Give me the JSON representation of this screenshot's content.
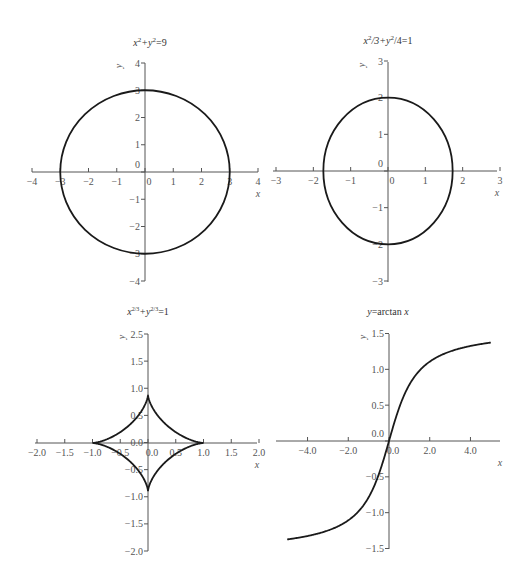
{
  "chart_data": [
    {
      "id": "circle",
      "type": "line",
      "title": "x²+y²=9",
      "equation": "x^2+y^2=9",
      "xlabel": "x",
      "ylabel": "y",
      "xlim": [
        -4,
        4
      ],
      "ylim": [
        -4,
        4
      ],
      "x_ticks": [
        -4,
        -3,
        -2,
        -1,
        0,
        1,
        2,
        3,
        4
      ],
      "y_ticks": [
        -4,
        -3,
        -2,
        -1,
        0,
        1,
        2,
        3,
        4
      ],
      "grid": false,
      "curve": {
        "kind": "ellipse",
        "a": 3,
        "b": 3
      },
      "box": {
        "left": 32,
        "top": 63,
        "right": 258,
        "bottom": 281,
        "ox": 145,
        "oy": 172
      },
      "title_pos": {
        "x": 150,
        "y": 42
      }
    },
    {
      "id": "ellipse",
      "type": "line",
      "title": "x²/3+y²/4=1",
      "equation": "x^2/3+y^2/4=1",
      "xlabel": "x",
      "ylabel": "y",
      "xlim": [
        -3,
        3
      ],
      "ylim": [
        -3,
        3
      ],
      "x_ticks": [
        -3,
        -2,
        -1,
        0,
        1,
        2,
        3
      ],
      "y_ticks": [
        -3,
        -2,
        -1,
        0,
        1,
        2,
        3
      ],
      "grid": false,
      "curve": {
        "kind": "ellipse",
        "a": 1.732,
        "b": 2
      },
      "box": {
        "left": 273,
        "top": 62,
        "right": 497,
        "bottom": 282,
        "ox": 388,
        "oy": 171
      },
      "title_pos": {
        "x": 388,
        "y": 40
      }
    },
    {
      "id": "astroid",
      "type": "line",
      "title": "x²ᐟ³+y²ᐟ³=1",
      "equation": "x^(2/3)+y^(2/3)=1",
      "xlabel": "x",
      "ylabel": "y",
      "xlim": [
        -2.0,
        2.0
      ],
      "ylim": [
        -2.0,
        2.5
      ],
      "x_ticks": [
        -2.0,
        -1.5,
        -1.0,
        -0.5,
        0.0,
        0.5,
        1.0,
        1.5,
        2.0
      ],
      "y_tick_labels": [
        "2.5",
        "1.5",
        "1.0",
        "0.5",
        "0.0",
        "-0.5",
        "-1.0",
        "-1.5",
        "-2.0"
      ],
      "grid": false,
      "curve": {
        "kind": "astroid",
        "a": 1
      },
      "box": {
        "left": 35,
        "top": 334,
        "right": 257,
        "bottom": 551,
        "ox": 148,
        "oy": 443
      },
      "title_pos": {
        "x": 148,
        "y": 313
      }
    },
    {
      "id": "arctan",
      "type": "line",
      "title": "y=arctan x",
      "equation": "y=arctan(x)",
      "xlabel": "x",
      "ylabel": "y",
      "xlim": [
        -5.5,
        5.5
      ],
      "ylim": [
        -1.5,
        1.5
      ],
      "x_ticks": [
        -4,
        -2,
        0,
        2,
        4
      ],
      "y_ticks": [
        -1.5,
        -1.0,
        -0.5,
        0.0,
        0.5,
        1.0,
        1.5
      ],
      "grid": false,
      "curve": {
        "kind": "arctan",
        "x_range": [
          -5,
          5
        ]
      },
      "sample_points": {
        "x": [
          -5,
          -4,
          -3,
          -2,
          -1,
          0,
          1,
          2,
          3,
          4,
          5
        ],
        "y": [
          -1.373,
          -1.326,
          -1.249,
          -1.107,
          -0.785,
          0,
          0.785,
          1.107,
          1.249,
          1.326,
          1.373
        ]
      },
      "box": {
        "left": 276,
        "top": 334,
        "right": 500,
        "bottom": 549,
        "ox": 389,
        "oy": 441
      },
      "title_pos": {
        "x": 388,
        "y": 313
      }
    }
  ],
  "titles": {
    "circle": {
      "pre": "x",
      "s1": "2",
      "mid": "+y",
      "s2": "2",
      "post": "=9"
    },
    "ellipse": {
      "pre": "x",
      "s1": "2",
      "mid": "/3+y",
      "s2": "2",
      "post": "/4=1"
    },
    "astroid": {
      "pre": "x",
      "s1": "2/3",
      "mid": "+y",
      "s2": "2/3",
      "post": "=1"
    },
    "arctan": {
      "pre": "y",
      "mid": "=arctan ",
      "post": "x"
    }
  }
}
